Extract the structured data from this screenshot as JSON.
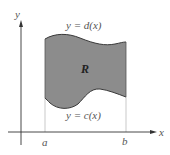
{
  "diagram": {
    "labels": {
      "y_axis": "y",
      "x_axis": "x",
      "top_curve": "y = d(x)",
      "bottom_curve": "y = c(x)",
      "region": "R",
      "a": "a",
      "b": "b"
    },
    "colors": {
      "region_fill": "#8c8c8c",
      "curve_stroke": "#3a3a3a",
      "axis": "#333333",
      "guide_line": "#bbbbbb"
    }
  }
}
